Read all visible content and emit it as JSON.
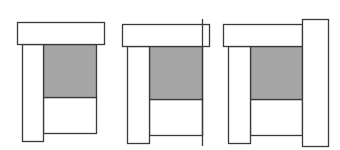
{
  "diagram": {
    "colors": {
      "background": "#ffffff",
      "stroke": "#3a3a3a",
      "shaded_fill": "#a6a6a6",
      "plain_fill": "#ffffff"
    },
    "figures": [
      {
        "id": "figure-1",
        "variant": "base",
        "top_bar": {
          "x": 17,
          "y": 22,
          "w": 87,
          "h": 22
        },
        "left_post": {
          "x": 22,
          "y": 44,
          "w": 21,
          "h": 97
        },
        "shaded_block": {
          "x": 43,
          "y": 44,
          "w": 53,
          "h": 53
        },
        "lower_panel": {
          "x": 43,
          "y": 97,
          "w": 53,
          "h": 36
        }
      },
      {
        "id": "figure-2",
        "variant": "with-vertical-line",
        "top_bar": {
          "x": 122,
          "y": 24,
          "w": 87,
          "h": 22
        },
        "left_post": {
          "x": 127,
          "y": 46,
          "w": 22,
          "h": 97
        },
        "shaded_block": {
          "x": 149,
          "y": 46,
          "w": 53,
          "h": 53
        },
        "lower_panel": {
          "x": 149,
          "y": 99,
          "w": 53,
          "h": 36
        },
        "vertical_line": {
          "x": 202,
          "y1": 19,
          "y2": 146
        }
      },
      {
        "id": "figure-3",
        "variant": "with-right-post",
        "top_bar": {
          "x": 223,
          "y": 24,
          "w": 79,
          "h": 22
        },
        "left_post": {
          "x": 228,
          "y": 46,
          "w": 22,
          "h": 97
        },
        "shaded_block": {
          "x": 250,
          "y": 46,
          "w": 52,
          "h": 53
        },
        "lower_panel": {
          "x": 250,
          "y": 99,
          "w": 52,
          "h": 36
        },
        "right_post": {
          "x": 302,
          "y": 19,
          "w": 26,
          "h": 127
        }
      }
    ]
  }
}
